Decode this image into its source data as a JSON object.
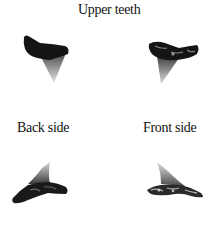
{
  "figure": {
    "title": "Upper teeth",
    "upper_row": {
      "left_tooth": "shark-tooth-upper-left",
      "right_tooth": "shark-tooth-upper-right"
    },
    "lower_row": {
      "left_label": "Back side",
      "right_label": "Front side",
      "left_tooth": "shark-tooth-back-side",
      "right_tooth": "shark-tooth-front-side"
    },
    "colors": {
      "root": "#141414",
      "blade_top": "#5a5a5a",
      "blade_tip": "#e0e0e0",
      "background": "#ffffff"
    }
  }
}
